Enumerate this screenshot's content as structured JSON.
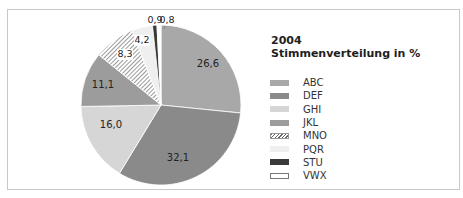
{
  "chart_data": {
    "type": "pie",
    "title": "2004",
    "subtitle": "Stimmenverteilung in %",
    "start_angle": "12 o'clock",
    "direction": "clockwise",
    "legend_position": "right",
    "categories": [
      "ABC",
      "DEF",
      "GHI",
      "JKL",
      "MNO",
      "PQR",
      "STU",
      "VWX"
    ],
    "values": [
      26.6,
      32.1,
      16.0,
      11.1,
      8.3,
      4.2,
      0.9,
      0.8
    ],
    "labels": [
      "26,6",
      "32,1",
      "16,0",
      "11,1",
      "8,3",
      "4,2",
      "0,9",
      "0,8"
    ],
    "colors": [
      "#a8a8a8",
      "#8a8a8a",
      "#d6d6d6",
      "#9c9c9c",
      "hatched",
      "#efefef",
      "#3a3a3a",
      "#ffffff"
    ]
  },
  "header": {
    "year": "2004",
    "subtitle": "Stimmenverteilung in %"
  },
  "legend": [
    {
      "label": "ABC",
      "color": "#a8a8a8",
      "style": "solid"
    },
    {
      "label": "DEF",
      "color": "#8a8a8a",
      "style": "solid"
    },
    {
      "label": "GHI",
      "color": "#d6d6d6",
      "style": "solid"
    },
    {
      "label": "JKL",
      "color": "#9c9c9c",
      "style": "solid"
    },
    {
      "label": "MNO",
      "color": "#ffffff",
      "style": "hatch"
    },
    {
      "label": "PQR",
      "color": "#efefef",
      "style": "solid"
    },
    {
      "label": "STU",
      "color": "#3a3a3a",
      "style": "solid"
    },
    {
      "label": "VWX",
      "color": "#ffffff",
      "style": "outline"
    }
  ]
}
